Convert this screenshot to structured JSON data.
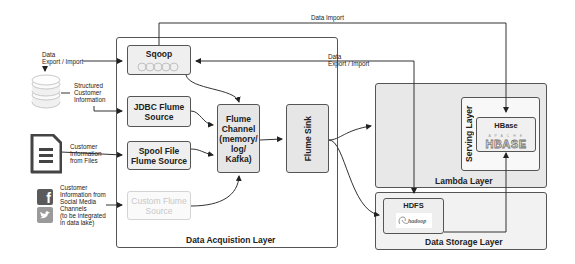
{
  "diagram": {
    "layers": {
      "acquisition": "Data Acquistion Layer",
      "lambda": "Lambda Layer",
      "serving": "Serving Layer",
      "storage": "Data Storage Layer"
    },
    "nodes": {
      "sqoop": {
        "label": "Sqoop",
        "logo": "sqoop"
      },
      "jdbc": {
        "line1": "JDBC Flume",
        "line2": "Source"
      },
      "spool": {
        "line1": "Spool File",
        "line2": "Flume Source"
      },
      "custom": {
        "line1": "Custom Flume",
        "line2": "Source"
      },
      "channel": {
        "line1": "Flume",
        "line2": "Channel",
        "line3": "(memory/",
        "line4": "log/",
        "line5": "Kafka)"
      },
      "sink": {
        "label": "Flume Sink"
      },
      "hbase": {
        "label": "HBase",
        "logo_top": "A P A C H E",
        "logo_main": "HBASE"
      },
      "hdfs": {
        "label": "HDFS",
        "logo": "hadoop"
      }
    },
    "sources": {
      "database": {
        "icon": "database-icon",
        "export_note": [
          "Data",
          "Export / Import"
        ],
        "note": [
          "Structured",
          "Customer",
          "Information"
        ]
      },
      "files": {
        "icon": "document-icon",
        "note": [
          "Customer",
          "Information",
          "from Files"
        ]
      },
      "social": {
        "icons": [
          "facebook-icon",
          "twitter-icon"
        ],
        "note": [
          "Customer",
          "Information from",
          "Social Media",
          "Channels",
          "(to be integrated",
          "in data lake)"
        ]
      }
    },
    "edge_labels": {
      "data_import": "Data Import",
      "export_import": [
        "Data",
        "Export / Import"
      ]
    },
    "colors": {
      "line": "#333333",
      "node_fill": "#efefef",
      "layer_fill": "#e8e8e8",
      "facebook": "#5a5a5a",
      "twitter": "#9a9a9a"
    }
  }
}
